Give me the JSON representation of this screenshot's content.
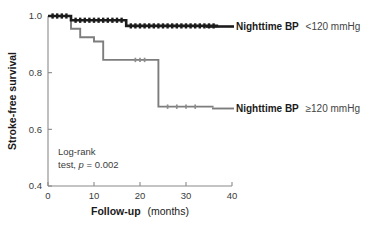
{
  "chart_data": {
    "type": "line",
    "subtype": "kaplan-meier-step",
    "title": "",
    "xlabel": "Follow-up",
    "xlabel_unit": "(months)",
    "ylabel": "Stroke-free survival",
    "xlim": [
      0,
      40
    ],
    "ylim": [
      0.4,
      1.0
    ],
    "xticks": [
      0,
      10,
      20,
      30,
      40
    ],
    "xtick_labels": [
      "0",
      "10",
      "20",
      "30",
      "40"
    ],
    "yticks": [
      0.4,
      0.6,
      0.8,
      1.0
    ],
    "ytick_labels": [
      "0.4",
      "0.6",
      "0.8",
      "1.0"
    ],
    "grid": false,
    "legend_position": "inline-right",
    "series": [
      {
        "name": "Nighttime BP <120 mmHg",
        "name_bold_part": "Nighttime BP",
        "name_light_part": "<120 mmHg",
        "color": "#1c1c1c",
        "x": [
          0,
          5,
          5,
          17,
          17,
          37
        ],
        "y": [
          1.0,
          1.0,
          0.985,
          0.985,
          0.965,
          0.965
        ],
        "censor_x": [
          1,
          2,
          3,
          4,
          6,
          7,
          8,
          9,
          10,
          11,
          12,
          13,
          14,
          15,
          16,
          18,
          19,
          20,
          21,
          22,
          23,
          24,
          25,
          26,
          27,
          28,
          29,
          30,
          31,
          32,
          33,
          34,
          35,
          36
        ],
        "censor_y": [
          1.0,
          1.0,
          1.0,
          1.0,
          0.985,
          0.985,
          0.985,
          0.985,
          0.985,
          0.985,
          0.985,
          0.985,
          0.985,
          0.985,
          0.985,
          0.965,
          0.965,
          0.965,
          0.965,
          0.965,
          0.965,
          0.965,
          0.965,
          0.965,
          0.965,
          0.965,
          0.965,
          0.965,
          0.965,
          0.965,
          0.965,
          0.965,
          0.965,
          0.965
        ]
      },
      {
        "name": "Nighttime BP ≥120 mmHg",
        "name_bold_part": "Nighttime BP",
        "name_light_part": "≥120 mmHg",
        "color": "#7d7d7d",
        "x": [
          0,
          5,
          5,
          7,
          7,
          10,
          10,
          12,
          12,
          24,
          24,
          36
        ],
        "y": [
          1.0,
          1.0,
          0.955,
          0.955,
          0.925,
          0.925,
          0.91,
          0.91,
          0.845,
          0.845,
          0.68,
          0.68
        ],
        "censor_x": [
          1,
          2,
          3,
          19,
          20,
          21,
          26,
          28,
          30,
          32
        ],
        "censor_y": [
          1.0,
          1.0,
          1.0,
          0.845,
          0.845,
          0.845,
          0.68,
          0.68,
          0.68,
          0.68
        ]
      }
    ],
    "annotations": [
      {
        "line1": "Log-rank",
        "line2_prefix": "test, ",
        "line2_italic": "p",
        "line2_suffix": " = 0.002",
        "x": 3.5,
        "y": 0.54
      }
    ]
  },
  "colors": {
    "axis": "#8a8a8a",
    "text": "#1a1a1a",
    "background": "#ffffff",
    "series_high": "#1c1c1c",
    "series_low": "#7d7d7d"
  }
}
